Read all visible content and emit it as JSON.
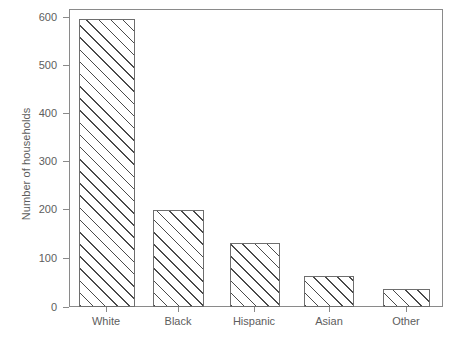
{
  "chart_data": {
    "type": "bar",
    "title": "",
    "xlabel": "",
    "ylabel": "Number of households",
    "categories": [
      "White",
      "Black",
      "Hispanic",
      "Asian",
      "Other"
    ],
    "values": [
      595,
      200,
      133,
      65,
      38
    ],
    "ylim": [
      0,
      600
    ],
    "yticks": [
      0,
      100,
      200,
      300,
      400,
      500,
      600
    ],
    "ytick_labels": [
      "0",
      "100",
      "200",
      "300",
      "400",
      "500",
      "600"
    ],
    "grid": false,
    "legend": null,
    "bar_style": {
      "fill": "hatched-diagonal-45",
      "edge_color": "#6e6e6e",
      "hatch_color": "#4a4a4a",
      "face_color": "#ffffff"
    },
    "axis_color": "#8a8a8a",
    "text_color": "#5d5d5d",
    "background": "#ffffff"
  }
}
